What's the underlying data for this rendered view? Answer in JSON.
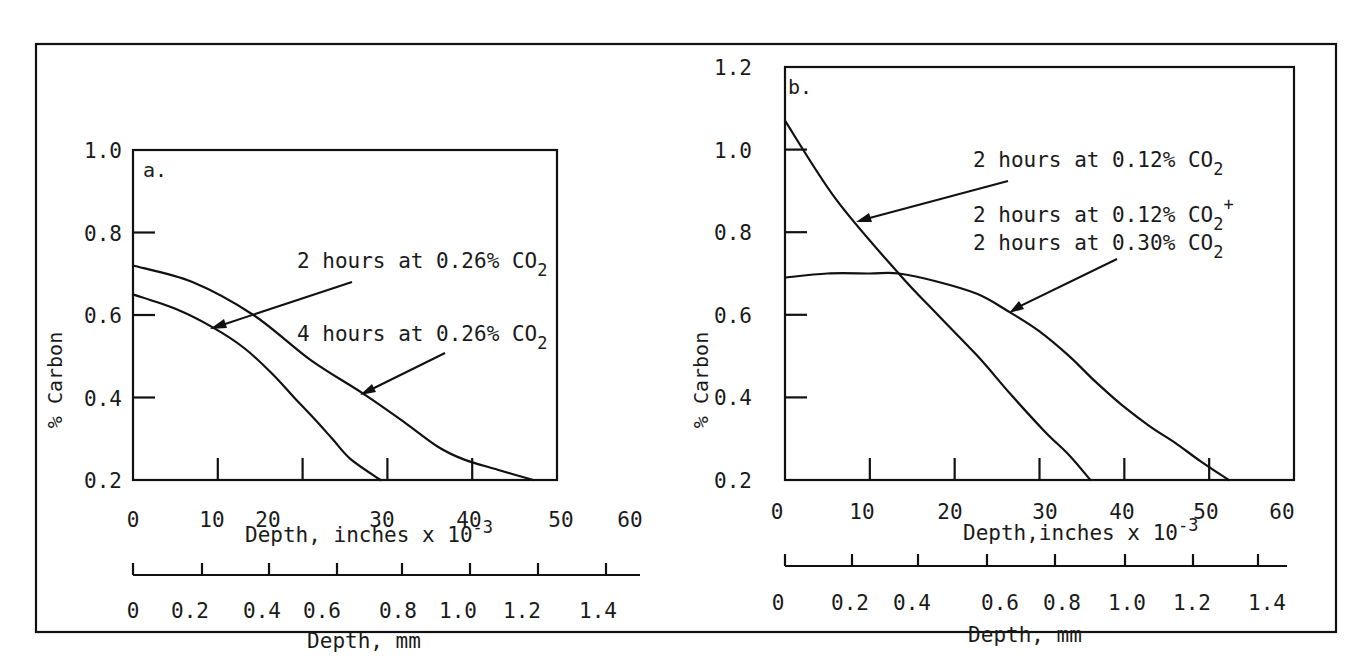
{
  "chart_data": [
    {
      "type": "line",
      "panel_label": "a.",
      "ylabel": "% Carbon",
      "xlabel": "Depth, inches x 10",
      "xlabel_superscript": "-3",
      "xlabel_secondary": "Depth, mm",
      "xlim": [
        0,
        50
      ],
      "ylim": [
        0.2,
        1.0
      ],
      "grid": false,
      "yticks": [
        0.2,
        0.4,
        0.6,
        0.8,
        1.0
      ],
      "ytick_labels": [
        "0.2",
        "0.4",
        "0.6",
        "0.8",
        "1.0"
      ],
      "xticks": [
        0,
        10,
        20,
        30,
        40,
        50
      ],
      "xtick_labels": [
        "0",
        "10",
        "20",
        "30",
        "40",
        "50",
        "60"
      ],
      "xtick_labels_secondary": [
        "0",
        "0.2",
        "0.4",
        "0.6",
        "0.8",
        "1.0",
        "1.2",
        "1.4"
      ],
      "series": [
        {
          "name": "2 hours at 0.26% CO2",
          "label_main": "2 hours at 0.26% CO",
          "label_sub": "2",
          "label_sup": "",
          "x": [
            0,
            5,
            9.4,
            13.1,
            16.3,
            19,
            21.3,
            23.5,
            25.7,
            29.2
          ],
          "y": [
            0.65,
            0.615,
            0.57,
            0.52,
            0.46,
            0.4,
            0.35,
            0.3,
            0.25,
            0.2
          ]
        },
        {
          "name": "4 hours at 0.26% CO2",
          "label_main": "4 hours at 0.26% CO",
          "label_sub": "2",
          "label_sup": "",
          "x": [
            0,
            7,
            14.2,
            21,
            27.1,
            32,
            36,
            39,
            43,
            47.2
          ],
          "y": [
            0.72,
            0.68,
            0.6,
            0.49,
            0.41,
            0.34,
            0.28,
            0.25,
            0.225,
            0.2
          ]
        }
      ]
    },
    {
      "type": "line",
      "panel_label": "b.",
      "ylabel": "% Carbon",
      "xlabel": "Depth,inches x 10",
      "xlabel_superscript": "-3",
      "xlabel_secondary": "Depth, mm",
      "xlim": [
        0,
        60
      ],
      "ylim": [
        0.2,
        1.2
      ],
      "grid": false,
      "yticks": [
        0.2,
        0.4,
        0.6,
        0.8,
        1.0,
        1.2
      ],
      "ytick_labels": [
        "0.2",
        "0.4",
        "0.6",
        "0.8",
        "1.0",
        "1.2"
      ],
      "xticks": [
        0,
        10,
        20,
        30,
        40,
        50,
        60
      ],
      "xtick_labels": [
        "0",
        "10",
        "20",
        "30",
        "40",
        "50",
        "60"
      ],
      "xtick_labels_secondary": [
        "0",
        "0.2",
        "0.4",
        "0.6",
        "0.8",
        "1.0",
        "1.2",
        "1.4"
      ],
      "series": [
        {
          "name": "2 hours at 0.12% CO2",
          "label_main": "2 hours at 0.12% CO",
          "label_sub": "2",
          "label_sup": "",
          "x": [
            0,
            6,
            13.4,
            18,
            22.7,
            26.5,
            30.5,
            33.5,
            36
          ],
          "y": [
            1.07,
            0.88,
            0.7,
            0.6,
            0.5,
            0.41,
            0.32,
            0.26,
            0.2
          ]
        },
        {
          "name": "2 hours at 0.12% CO2+ 2 hours at 0.30% CO2",
          "label_main": "2 hours at 0.12% CO",
          "label_sub": "2",
          "label_sup": "+",
          "label_line2_main": "2 hours at 0.30% CO",
          "label_line2_sub": "2",
          "x": [
            0,
            5,
            10,
            13.4,
            18,
            22.7,
            26.2,
            30,
            33.5,
            36.5,
            39.8,
            43,
            46,
            49,
            52.3
          ],
          "y": [
            0.69,
            0.7,
            0.7,
            0.7,
            0.68,
            0.65,
            0.61,
            0.56,
            0.5,
            0.44,
            0.38,
            0.33,
            0.29,
            0.245,
            0.2
          ]
        }
      ]
    }
  ]
}
